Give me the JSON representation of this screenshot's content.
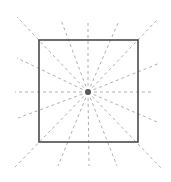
{
  "diagram": {
    "canvas": {
      "width": 171,
      "height": 182
    },
    "colors": {
      "background": "#ffffff",
      "square_stroke": "#4a4a4a",
      "ray_stroke": "#b0b0b0",
      "center_point": "#5a5a5a"
    },
    "square": {
      "x1": 39,
      "y1": 40,
      "x2": 138,
      "y2": 142
    },
    "center": {
      "x": 88,
      "y": 92,
      "r": 3
    },
    "rays": [
      {
        "x": 17,
        "y": 17
      },
      {
        "x": 61,
        "y": 20
      },
      {
        "x": 88,
        "y": 23
      },
      {
        "x": 118,
        "y": 23
      },
      {
        "x": 157,
        "y": 20
      },
      {
        "x": 160,
        "y": 63
      },
      {
        "x": 153,
        "y": 92
      },
      {
        "x": 157,
        "y": 122
      },
      {
        "x": 161,
        "y": 168
      },
      {
        "x": 117,
        "y": 166
      },
      {
        "x": 89,
        "y": 166
      },
      {
        "x": 58,
        "y": 166
      },
      {
        "x": 14,
        "y": 168
      },
      {
        "x": 18,
        "y": 118
      },
      {
        "x": 15,
        "y": 92
      },
      {
        "x": 17,
        "y": 58
      }
    ]
  }
}
